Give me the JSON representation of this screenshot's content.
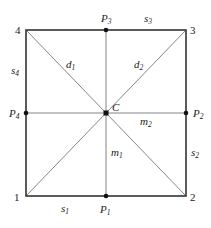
{
  "diagram": {
    "title": "",
    "line_color": "#333333",
    "thin_line_color": "#777777",
    "square": {
      "x1": 26,
      "y1": 30,
      "x2": 186,
      "y2": 196
    },
    "center": {
      "name": "C",
      "x": 106,
      "y": 113
    },
    "corners": [
      {
        "id": "1",
        "x": 26,
        "y": 196
      },
      {
        "id": "2",
        "x": 186,
        "y": 196
      },
      {
        "id": "3",
        "x": 186,
        "y": 30
      },
      {
        "id": "4",
        "x": 26,
        "y": 30
      }
    ],
    "midpoints": [
      {
        "base": "P",
        "sub": "1",
        "x": 106,
        "y": 196
      },
      {
        "base": "P",
        "sub": "2",
        "x": 186,
        "y": 113
      },
      {
        "base": "P",
        "sub": "3",
        "x": 106,
        "y": 30
      },
      {
        "base": "P",
        "sub": "4",
        "x": 26,
        "y": 113
      }
    ],
    "side_labels": [
      {
        "base": "s",
        "sub": "1"
      },
      {
        "base": "s",
        "sub": "2"
      },
      {
        "base": "s",
        "sub": "3"
      },
      {
        "base": "s",
        "sub": "4"
      }
    ],
    "diagonal_labels": [
      {
        "base": "d",
        "sub": "1"
      },
      {
        "base": "d",
        "sub": "2"
      }
    ],
    "median_labels": [
      {
        "base": "m",
        "sub": "1"
      },
      {
        "base": "m",
        "sub": "2"
      }
    ]
  }
}
